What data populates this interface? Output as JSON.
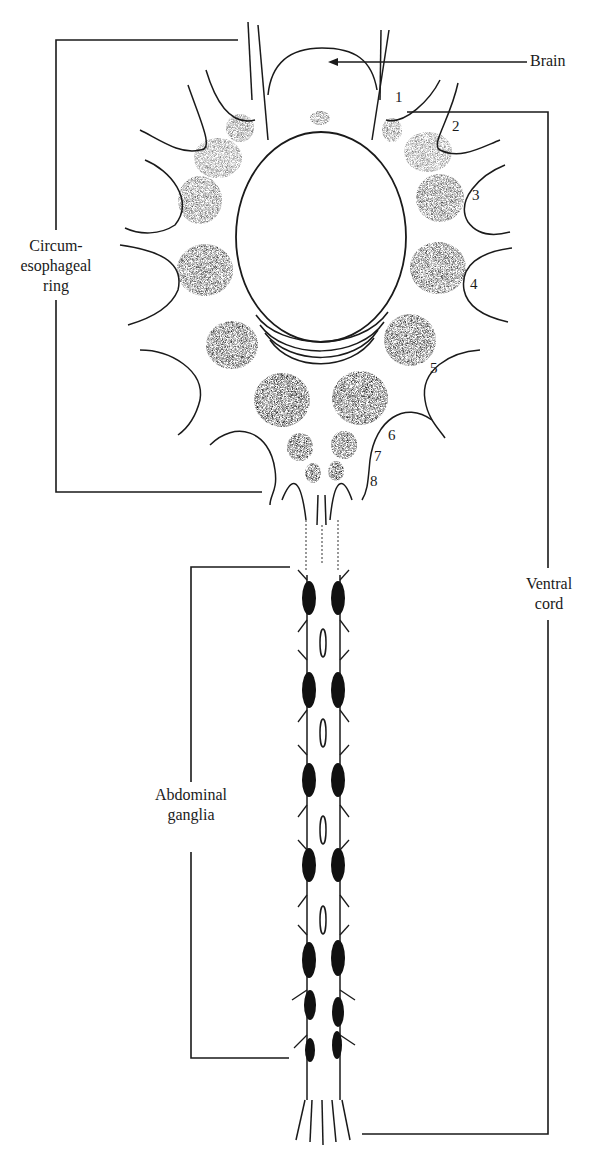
{
  "diagram": {
    "labels": {
      "brain": "Brain",
      "circum_line1": "Circum-",
      "circum_line2": "esophageal",
      "circum_line3": "ring",
      "ventral_line1": "Ventral",
      "ventral_line2": "cord",
      "abdominal_line1": "Abdominal",
      "abdominal_line2": "ganglia"
    },
    "ganglion_numbers": [
      "1",
      "2",
      "3",
      "4",
      "5",
      "6",
      "7",
      "8"
    ],
    "colors": {
      "ink": "#1a1a1a",
      "background": "#ffffff"
    }
  }
}
